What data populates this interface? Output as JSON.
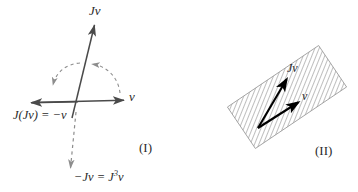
{
  "figure": {
    "background_color": "#ffffff",
    "solid_stroke_color": "#4a4a4a",
    "dashed_stroke_color": "#8d8d8d",
    "vector_color": "#000000",
    "hatch_color": "#6e6e6e",
    "text_color": "#2b2b2b",
    "width": 358,
    "height": 192
  },
  "panel_one": {
    "id": "panel-I",
    "caption": "(I)",
    "labels": {
      "jv_top": "Jv",
      "v_axis": "v",
      "j_jv_equals_minus_v": "J(Jv) = −v",
      "minus_jv_equals_j3v_base": "−Jv = J",
      "minus_jv_exponent": "3",
      "minus_jv_tail": "v"
    },
    "axes": {
      "horizontal_axis_name": "v-axis",
      "vertical_axis_name": "Jv-axis",
      "horizontal_left_end": [
        30,
        103
      ],
      "horizontal_right_end": [
        127,
        100
      ],
      "jv_arrow_tip": [
        94,
        22
      ],
      "jv_origin": [
        76,
        110
      ],
      "minus_jv_dashed_tip": [
        72,
        172
      ]
    },
    "rotation_arcs": [
      {
        "name": "arc-v-to-jv",
        "description": "dashed quarter-turn arc from v axis up to Jv",
        "arrowhead_at": "upper-middle"
      },
      {
        "name": "arc-jv-to-minus-v",
        "description": "dashed quarter-turn arc from Jv to −v",
        "arrowhead_at": "left-down"
      }
    ]
  },
  "panel_two": {
    "id": "panel-II",
    "caption": "(II)",
    "labels": {
      "jv": "Jv",
      "v": "v"
    },
    "plane": {
      "name": "hatched-plane",
      "rotation_degrees": -34,
      "hatch_spacing_px": 4,
      "corners": [
        [
          232,
          101
        ],
        [
          300,
          46
        ],
        [
          341,
          94
        ],
        [
          272,
          148
        ]
      ]
    },
    "vectors": [
      {
        "name": "vector-jv",
        "from": [
          258,
          128
        ],
        "to": [
          288,
          77
        ],
        "label": "Jv"
      },
      {
        "name": "vector-v",
        "from": [
          258,
          128
        ],
        "to": [
          300,
          101
        ],
        "label": "v"
      }
    ]
  }
}
